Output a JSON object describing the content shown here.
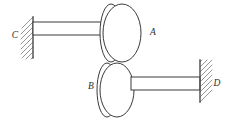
{
  "figure": {
    "type": "mechanical-diagram",
    "background_color": "#ffffff",
    "line_color": "#3a3a3a",
    "hatch_color": "#8a8a8a"
  },
  "labels": {
    "disc_upper": "A",
    "disc_lower": "B",
    "wall_left": "C",
    "wall_right": "D"
  },
  "components": {
    "upper_disc": {
      "name": "A",
      "cx": 122,
      "cy": 33,
      "rx": 19,
      "ry": 29,
      "offset_rx": 11,
      "offset_cx": 111
    },
    "lower_disc": {
      "name": "B",
      "cx": 117,
      "cy": 90,
      "rx": 17,
      "ry": 27,
      "offset_rx": 10,
      "offset_cx": 107
    },
    "upper_shaft": {
      "x1": 33,
      "y1": 22,
      "x2": 107,
      "y2": 35
    },
    "lower_shaft": {
      "x1": 131,
      "y1": 77,
      "x2": 200,
      "y2": 90
    },
    "left_wall": {
      "name": "C",
      "x": 33,
      "y_top": 17,
      "y_bottom": 58,
      "hatch_side": "left"
    },
    "right_wall": {
      "name": "D",
      "x": 200,
      "y_top": 60,
      "y_bottom": 102,
      "hatch_side": "right"
    }
  },
  "label_positions": {
    "A": {
      "x": 153,
      "y": 33
    },
    "B": {
      "x": 91,
      "y": 87
    },
    "C": {
      "x": 15,
      "y": 36
    },
    "D": {
      "x": 217,
      "y": 84
    }
  }
}
